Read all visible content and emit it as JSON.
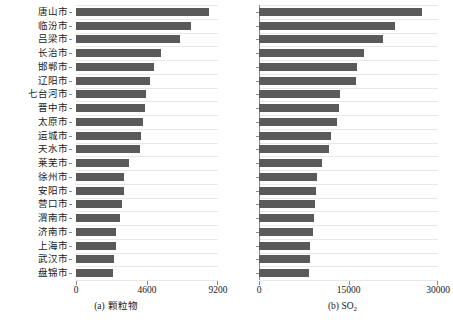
{
  "figure": {
    "bar_color": "#5a5a5a",
    "grid_color": "#e8e8e8",
    "axis_color": "#8a8a8a",
    "background": "#ffffff"
  },
  "chart_data": [
    {
      "type": "bar",
      "orientation": "horizontal",
      "title": "(a) 颗粒物",
      "panel_label": "(a)",
      "panel_name": "颗粒物",
      "xlabel": "",
      "ylabel": "",
      "xlim": [
        0,
        9200
      ],
      "xticks": [
        0,
        4600,
        9200
      ],
      "xtick_labels": [
        "0",
        "4600",
        "9200"
      ],
      "grid": true,
      "grid_axis": "y",
      "legend": "none",
      "categories": [
        "唐山市",
        "临汾市",
        "吕梁市",
        "长治市",
        "邯郸市",
        "辽阳市",
        "七台河市",
        "晋中市",
        "太原市",
        "运城市",
        "天水市",
        "莱芜市",
        "徐州市",
        "安阳市",
        "营口市",
        "渭南市",
        "济南市",
        "上海市",
        "武汉市",
        "盘锦市"
      ],
      "values": [
        8640,
        7480,
        6760,
        5500,
        5050,
        4800,
        4560,
        4500,
        4350,
        4200,
        4150,
        3450,
        3120,
        3100,
        2980,
        2880,
        2620,
        2600,
        2490,
        2420
      ]
    },
    {
      "type": "bar",
      "orientation": "horizontal",
      "title": "(b) SO2",
      "panel_label": "(b)",
      "panel_name": "SO₂",
      "xlabel": "",
      "ylabel": "",
      "xlim": [
        0,
        30000
      ],
      "xticks": [
        0,
        15000,
        30000
      ],
      "xtick_labels": [
        "0",
        "15000",
        "30000"
      ],
      "grid": true,
      "grid_axis": "y",
      "legend": "none",
      "categories": [
        "唐山市",
        "临汾市",
        "吕梁市",
        "长治市",
        "邯郸市",
        "辽阳市",
        "七台河市",
        "晋中市",
        "太原市",
        "运城市",
        "天水市",
        "莱芜市",
        "徐州市",
        "安阳市",
        "营口市",
        "渭南市",
        "济南市",
        "上海市",
        "武汉市",
        "盘锦市"
      ],
      "values": [
        27300,
        22800,
        20800,
        17600,
        16400,
        16300,
        13500,
        13400,
        13000,
        12100,
        11800,
        10600,
        9700,
        9500,
        9400,
        9200,
        9100,
        8600,
        8500,
        8300
      ]
    }
  ]
}
